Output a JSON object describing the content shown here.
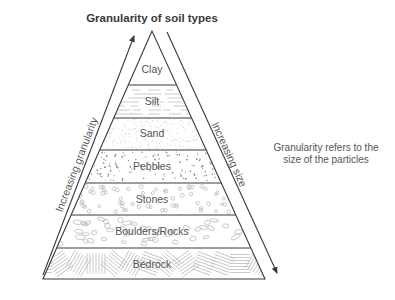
{
  "title": "Granularity of soil types",
  "layers": [
    {
      "name": "Clay",
      "texture": "plain"
    },
    {
      "name": "Silt",
      "texture": "dashes"
    },
    {
      "name": "Sand",
      "texture": "fine-dots"
    },
    {
      "name": "Pebbles",
      "texture": "dots"
    },
    {
      "name": "Stones",
      "texture": "small-circles"
    },
    {
      "name": "Boulders/Rocks",
      "texture": "ovals"
    },
    {
      "name": "Bedrock",
      "texture": "hatching"
    }
  ],
  "left_axis": {
    "label": "Increasing granularity",
    "direction": "up"
  },
  "right_axis": {
    "label": "Increasing size",
    "direction": "down"
  },
  "note": {
    "line1": "Granularity refers to the",
    "line2": "size of the particles"
  },
  "colors": {
    "line": "#3a3a3a",
    "text": "#555555",
    "texture": "#b5b5b5"
  }
}
